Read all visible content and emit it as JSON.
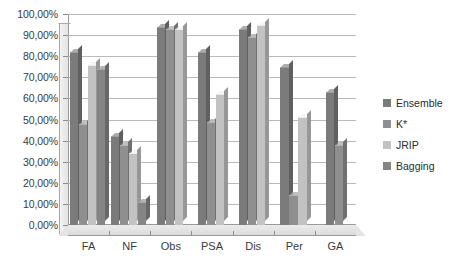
{
  "chart_data": {
    "type": "bar",
    "title": "",
    "subtitle": "",
    "xlabel": "",
    "ylabel": "",
    "categories": [
      "FA",
      "NF",
      "Obs",
      "PSA",
      "Dis",
      "Per",
      "GA"
    ],
    "series": [
      {
        "name": "Ensemble",
        "color": "#7b7b7b",
        "values": [
          82,
          42,
          94,
          82,
          93,
          75,
          63
        ]
      },
      {
        "name": "K*",
        "color": "#8f8f8f",
        "values": [
          48,
          38,
          93,
          49,
          89,
          14,
          38
        ]
      },
      {
        "name": "JRIP",
        "color": "#c2c2c2",
        "values": [
          76,
          34,
          93,
          62,
          95,
          51,
          null
        ]
      },
      {
        "name": "Bagging",
        "color": "#858585",
        "values": [
          74,
          11,
          null,
          null,
          null,
          null,
          null
        ]
      }
    ],
    "ylim": [
      0,
      100
    ],
    "ytick_step": 10,
    "ytick_labels": [
      "0,00%",
      "10,00%",
      "20,00%",
      "30,00%",
      "40,00%",
      "50,00%",
      "60,00%",
      "70,00%",
      "80,00%",
      "90,00%",
      "100,00%"
    ],
    "grid": true,
    "legend_position": "right",
    "value_suffix": "%",
    "decimal_separator": ",",
    "style": "3d-clustered-column"
  },
  "legend": {
    "items": [
      {
        "label": "Ensemble"
      },
      {
        "label": "K*"
      },
      {
        "label": "JRIP"
      },
      {
        "label": "Bagging"
      }
    ]
  }
}
